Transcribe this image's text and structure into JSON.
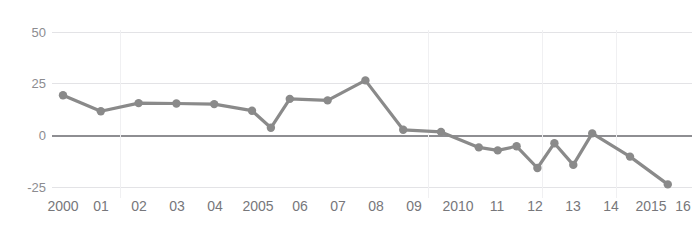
{
  "title_fragment": "",
  "colors": {
    "series": "#8a8a8a",
    "grid": "#e3e3e6",
    "zero_line": "#8e8e92",
    "tick_text": "#8c8c90",
    "background": "#ffffff"
  },
  "axis": {
    "y_ticks": [
      "50",
      "25",
      "0",
      "-25"
    ],
    "x_ticks": [
      "2000",
      "01",
      "02",
      "03",
      "04",
      "2005",
      "06",
      "07",
      "08",
      "09",
      "2010",
      "11",
      "12",
      "13",
      "14",
      "2015",
      "16"
    ]
  },
  "chart_data": {
    "type": "line",
    "title": "",
    "subtitle": "",
    "xlabel": "",
    "ylabel": "",
    "ylim": [
      -25,
      50
    ],
    "yticks": [
      -25,
      0,
      25,
      50
    ],
    "grid": true,
    "legend": "none",
    "markers": true,
    "categories": [
      "2000",
      "01",
      "02",
      "03",
      "04",
      "2005",
      "06",
      "07",
      "08",
      "09",
      "2010",
      "11",
      "12",
      "13",
      "14",
      "2015",
      "16"
    ],
    "x": [
      2000,
      2001,
      2002,
      2003,
      2004,
      2005,
      2006,
      2007,
      2008,
      2009,
      2010,
      2011,
      2012,
      2013,
      2014,
      2015,
      2016
    ],
    "values": [
      19.3,
      11.5,
      15.5,
      15.3,
      15.0,
      11.8,
      17.5,
      16.8,
      26.5,
      2.5,
      1.5,
      -6.0,
      -5.5,
      -4.0,
      0.8,
      -10.5,
      -24.0
    ],
    "series": [
      {
        "name": "series-1",
        "color": "#8a8a8a",
        "points": [
          {
            "x": "2000",
            "y": 19.3
          },
          {
            "x": "01",
            "y": 11.5
          },
          {
            "x": "02",
            "y": 15.5
          },
          {
            "x": "03",
            "y": 15.3
          },
          {
            "x": "04",
            "y": 15.0
          },
          {
            "x": "2005",
            "y": 11.8
          },
          {
            "x": "06",
            "y": 17.5
          },
          {
            "x": "07",
            "y": 16.8
          },
          {
            "x": "08",
            "y": 26.5
          },
          {
            "x": "09",
            "y": 2.5
          },
          {
            "x": "2010",
            "y": 1.5
          },
          {
            "x": "11",
            "y": -6.0
          },
          {
            "x": "12",
            "y": -5.5
          },
          {
            "x": "13",
            "y": -4.0
          },
          {
            "x": "14",
            "y": 0.8
          },
          {
            "x": "2015",
            "y": -10.5
          },
          {
            "x": "16",
            "y": -24.0
          }
        ],
        "intermediate_points": [
          {
            "y": 3.5,
            "note": "mid-dip between 04 and 06"
          },
          {
            "y": -7.5,
            "note": "dip between 11 and 12"
          },
          {
            "y": -14.5,
            "note": "dip before 14"
          },
          {
            "y": -16.0,
            "note": "trough at 13"
          }
        ]
      }
    ]
  }
}
